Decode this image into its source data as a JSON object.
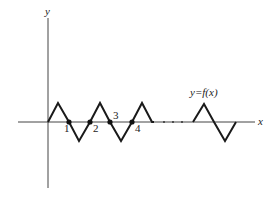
{
  "diagram": {
    "type": "function-graph",
    "axes": {
      "x_label": "x",
      "y_label": "y",
      "origin": [
        48,
        122
      ],
      "x_axis": {
        "from": 18,
        "to": 255
      },
      "y_axis": {
        "from": 18,
        "to": 188
      }
    },
    "curve_label": "y=f(x)",
    "curve_segments": [
      {
        "name": "main-zigzag",
        "points": [
          [
            48,
            122
          ],
          [
            58,
            103
          ],
          [
            69,
            122
          ],
          [
            79,
            141
          ],
          [
            90,
            122
          ],
          [
            100,
            103
          ],
          [
            110,
            122
          ],
          [
            121,
            141
          ],
          [
            132,
            122
          ],
          [
            142,
            103
          ],
          [
            152,
            122
          ],
          [
            154,
            122
          ]
        ]
      },
      {
        "name": "tail-zigzag",
        "points": [
          [
            193,
            122
          ],
          [
            204,
            104
          ],
          [
            214,
            122
          ],
          [
            225,
            141
          ],
          [
            236,
            122
          ]
        ]
      }
    ],
    "zero_points": [
      {
        "label": "1",
        "x": 69,
        "y": 122,
        "label_x": 64,
        "label_y": 132
      },
      {
        "label": "2",
        "x": 90,
        "y": 122,
        "label_x": 93,
        "label_y": 132
      },
      {
        "label": "3",
        "x": 110,
        "y": 122,
        "label_x": 113,
        "label_y": 119
      },
      {
        "label": "4",
        "x": 132,
        "y": 122,
        "label_x": 135,
        "label_y": 132
      }
    ],
    "ellipsis_dots": [
      164,
      173,
      182
    ],
    "colors": {
      "curve": "#1a1a1a",
      "axis": "#444444",
      "text": "#222222"
    }
  }
}
